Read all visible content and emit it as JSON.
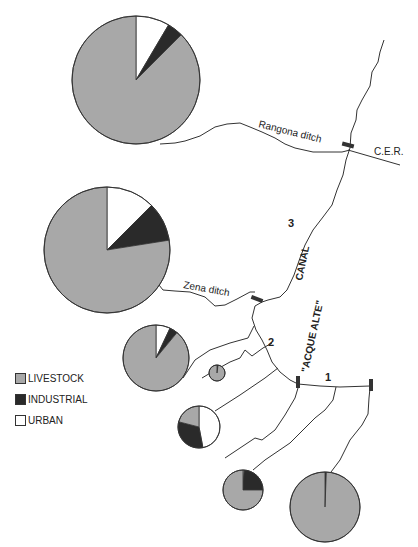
{
  "labels": {
    "rangona": "Rangona ditch",
    "cer": "C.E.R.",
    "zena": "Zena ditch",
    "canal": "CANAL",
    "acque_alte": "\"ACQUE ALTE\"",
    "seg1": "1",
    "seg2": "2",
    "seg3": "3"
  },
  "colors": {
    "livestock": "#a8a8a8",
    "industrial": "#2a2a2a",
    "urban": "#ffffff",
    "line": "#333333"
  },
  "legend": [
    {
      "key": "livestock",
      "label": "LIVESTOCK"
    },
    {
      "key": "industrial",
      "label": "INDUSTRIAL"
    },
    {
      "key": "urban",
      "label": "URBAN"
    }
  ],
  "pies": [
    {
      "id": "rangona-pie",
      "cx": 136,
      "cy": 80,
      "r": 64,
      "slices": [
        {
          "key": "urban",
          "pct": 8.5
        },
        {
          "key": "industrial",
          "pct": 4
        },
        {
          "key": "livestock",
          "pct": 87.5
        }
      ]
    },
    {
      "id": "zena-pie",
      "cx": 107,
      "cy": 250,
      "r": 63,
      "slices": [
        {
          "key": "urban",
          "pct": 12.5
        },
        {
          "key": "industrial",
          "pct": 10
        },
        {
          "key": "livestock",
          "pct": 77.5
        }
      ]
    },
    {
      "id": "pie-3",
      "cx": 156,
      "cy": 358,
      "r": 33,
      "slices": [
        {
          "key": "urban",
          "pct": 7
        },
        {
          "key": "industrial",
          "pct": 4
        },
        {
          "key": "livestock",
          "pct": 89
        }
      ]
    },
    {
      "id": "pie-4",
      "cx": 217,
      "cy": 373,
      "r": 8,
      "slices": [
        {
          "key": "urban",
          "pct": 1
        },
        {
          "key": "industrial",
          "pct": 1
        },
        {
          "key": "livestock",
          "pct": 98
        }
      ]
    },
    {
      "id": "pie-5",
      "cx": 199,
      "cy": 427,
      "r": 21,
      "slices": [
        {
          "key": "urban",
          "pct": 47
        },
        {
          "key": "industrial",
          "pct": 32
        },
        {
          "key": "livestock",
          "pct": 21
        }
      ]
    },
    {
      "id": "pie-6",
      "cx": 243,
      "cy": 490,
      "r": 20,
      "slices": [
        {
          "key": "urban",
          "pct": 1
        },
        {
          "key": "industrial",
          "pct": 24
        },
        {
          "key": "livestock",
          "pct": 75
        }
      ]
    },
    {
      "id": "pie-7",
      "cx": 325,
      "cy": 507,
      "r": 35,
      "slices": [
        {
          "key": "urban",
          "pct": 0.3
        },
        {
          "key": "industrial",
          "pct": 0.3
        },
        {
          "key": "livestock",
          "pct": 99.4
        }
      ]
    }
  ]
}
